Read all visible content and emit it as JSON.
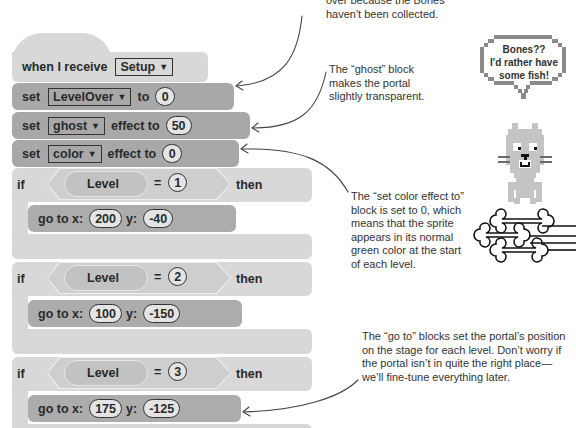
{
  "top_note": {
    "line1_partial": "over because the Bones",
    "line2": "haven't been collected."
  },
  "script": {
    "hat": {
      "label": "when I receive",
      "dropdown": "Setup"
    },
    "set_var": {
      "label_set": "set",
      "dropdown": "LevelOver",
      "label_to": "to",
      "value": "0"
    },
    "set_ghost": {
      "label_set": "set",
      "dropdown": "ghost",
      "label_effect": "effect to",
      "value": "50"
    },
    "set_color": {
      "label_set": "set",
      "dropdown": "color",
      "label_effect": "effect to",
      "value": "0"
    },
    "if_blocks": [
      {
        "if_label": "if",
        "variable": "Level",
        "operator": "=",
        "compare": "1",
        "then_label": "then",
        "goto": {
          "label": "go to x:",
          "x": "200",
          "y_label": "y:",
          "y": "-40"
        }
      },
      {
        "if_label": "if",
        "variable": "Level",
        "operator": "=",
        "compare": "2",
        "then_label": "then",
        "goto": {
          "label": "go to x:",
          "x": "100",
          "y_label": "y:",
          "y": "-150"
        }
      },
      {
        "if_label": "if",
        "variable": "Level",
        "operator": "=",
        "compare": "3",
        "then_label": "then",
        "goto": {
          "label": "go to x:",
          "x": "175",
          "y_label": "y:",
          "y": "-125"
        }
      }
    ]
  },
  "annotations": {
    "ghost": [
      "The “ghost” block",
      "makes the portal",
      "slightly transparent."
    ],
    "color": [
      "The “set color effect to”",
      "block is set to 0, which",
      "means that the sprite",
      "appears in its normal",
      "green color at the start",
      "of each level."
    ],
    "goto": [
      "The “go to” blocks set the portal’s position",
      "on the stage for each level. Don’t worry if",
      "the portal isn’t in quite the right place—",
      "we’ll fine-tune everything later."
    ]
  },
  "sprite": {
    "speech_lines": [
      "Bones??",
      "I'd rather have",
      "some fish!"
    ],
    "icons": [
      "cat-sprite",
      "bones-pile"
    ]
  },
  "colors": {
    "hat_block": "#d8d8d8",
    "data_block": "#a8a8a8",
    "control_block": "#d8d8d8",
    "text": "#2a2a2a"
  }
}
